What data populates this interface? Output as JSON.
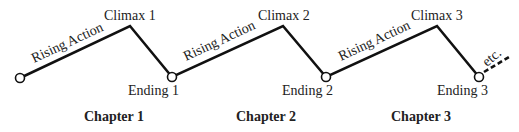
{
  "diagram": {
    "type": "chapter-plot-structure",
    "chapters": [
      {
        "label": "Chapter 1",
        "rising": "Rising Action",
        "climax": "Climax 1",
        "ending": "Ending 1"
      },
      {
        "label": "Chapter 2",
        "rising": "Rising Action",
        "climax": "Climax 2",
        "ending": "Ending 2"
      },
      {
        "label": "Chapter 3",
        "rising": "Rising Action",
        "climax": "Climax 3",
        "ending": "Ending 3"
      }
    ],
    "continuation": "etc.",
    "colors": {
      "line": "#111111",
      "text": "#222222",
      "background": "#ffffff"
    }
  }
}
